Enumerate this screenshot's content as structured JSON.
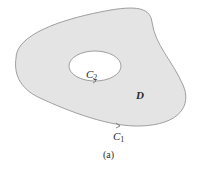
{
  "figure": {
    "caption": "(a)",
    "region_label": "D",
    "outer_curve": {
      "name": "C",
      "subscript": "1"
    },
    "inner_curve": {
      "name": "C",
      "subscript": "2"
    },
    "colors": {
      "region_fill": "#e4e4e4",
      "hole_fill": "#ffffff",
      "stroke": "#8a8a8a"
    }
  }
}
